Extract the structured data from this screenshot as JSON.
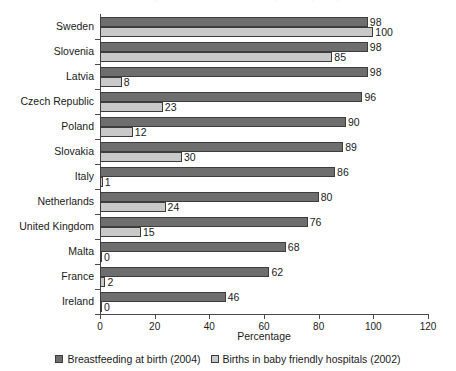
{
  "chart_data": {
    "type": "bar",
    "orientation": "horizontal",
    "title": "Breastfeeding at birth and births in baby friendly hospitals",
    "xlabel": "Percentage",
    "ylabel": "",
    "xlim": [
      0,
      120
    ],
    "xticks": [
      0,
      20,
      40,
      60,
      80,
      100,
      120
    ],
    "grid": false,
    "legend_position": "bottom",
    "categories": [
      "Sweden",
      "Slovenia",
      "Latvia",
      "Czech Republic",
      "Poland",
      "Slovakia",
      "Italy",
      "Netherlands",
      "United Kingdom",
      "Malta",
      "France",
      "Ireland"
    ],
    "series": [
      {
        "name": "Breastfeeding at birth (2004)",
        "color": "#6e6e6e",
        "values": [
          98,
          98,
          98,
          96,
          90,
          89,
          86,
          80,
          76,
          68,
          62,
          46
        ]
      },
      {
        "name": "Births in baby friendly hospitals (2002)",
        "color": "#c9c9c9",
        "values": [
          100,
          85,
          8,
          23,
          12,
          30,
          1,
          24,
          15,
          0,
          2,
          0
        ]
      }
    ]
  }
}
